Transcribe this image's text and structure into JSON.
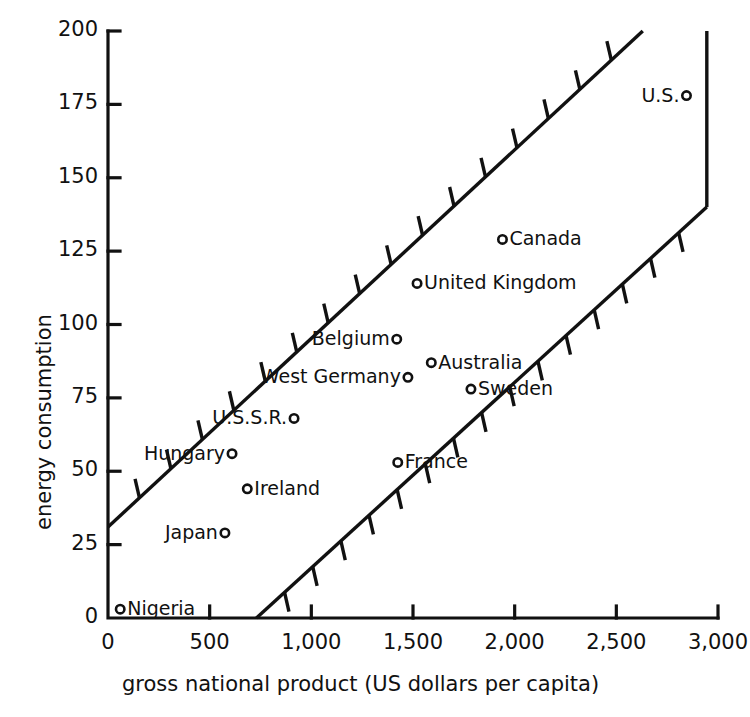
{
  "chart_data": {
    "type": "scatter",
    "title": "",
    "xlabel": "gross national product (US dollars per capita)",
    "ylabel": "energy consumption",
    "xlim": [
      0,
      3000
    ],
    "ylim": [
      0,
      200
    ],
    "xticks": [
      "0",
      "500",
      "1,000",
      "1,500",
      "2,000",
      "2,500",
      "3,000"
    ],
    "xtick_values": [
      0,
      500,
      1000,
      1500,
      2000,
      2500,
      3000
    ],
    "yticks": [
      "0",
      "25",
      "50",
      "75",
      "100",
      "125",
      "150",
      "175",
      "200"
    ],
    "ytick_values": [
      0,
      25,
      50,
      75,
      100,
      125,
      150,
      175,
      200
    ],
    "grid": false,
    "legend": "none",
    "points": [
      {
        "label": "Nigeria",
        "x": 60,
        "y": 3,
        "label_side": "right"
      },
      {
        "label": "Japan",
        "x": 575,
        "y": 29,
        "label_side": "left"
      },
      {
        "label": "Hungary",
        "x": 610,
        "y": 56,
        "label_side": "left"
      },
      {
        "label": "Ireland",
        "x": 685,
        "y": 44,
        "label_side": "right"
      },
      {
        "label": "U.S.S.R.",
        "x": 915,
        "y": 68,
        "label_side": "left"
      },
      {
        "label": "West Germany",
        "x": 1475,
        "y": 82,
        "label_side": "left"
      },
      {
        "label": "Belgium",
        "x": 1420,
        "y": 95,
        "label_side": "left"
      },
      {
        "label": "France",
        "x": 1425,
        "y": 53,
        "label_side": "right"
      },
      {
        "label": "United Kingdom",
        "x": 1520,
        "y": 114,
        "label_side": "right"
      },
      {
        "label": "Australia",
        "x": 1590,
        "y": 87,
        "label_side": "right"
      },
      {
        "label": "Sweden",
        "x": 1785,
        "y": 78,
        "label_side": "right"
      },
      {
        "label": "Canada",
        "x": 1940,
        "y": 129,
        "label_side": "right"
      },
      {
        "label": "U.S.",
        "x": 2845,
        "y": 178,
        "label_side": "left"
      }
    ],
    "band": {
      "description": "hatched envelope band enclosing the data",
      "upper_line": {
        "x1": 0,
        "y1": 31,
        "x2": 2630,
        "y2": 200
      },
      "lower_line": {
        "x1": 730,
        "y1": 0,
        "x2": 2945,
        "y2": 140
      },
      "right_edge": {
        "x": 2945,
        "y1": 200,
        "y2": 140
      }
    }
  }
}
